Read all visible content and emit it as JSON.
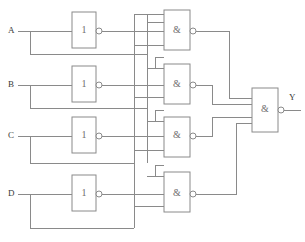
{
  "figure": {
    "caption": "",
    "background_color": "#ffffff",
    "wire_color": "#8a8a8a",
    "label_color": "#3a3a3a"
  },
  "inputs": [
    {
      "id": "A",
      "label": "A",
      "y": 31
    },
    {
      "id": "B",
      "label": "B",
      "y": 85
    },
    {
      "id": "C",
      "label": "C",
      "y": 136
    },
    {
      "id": "D",
      "label": "D",
      "y": 194
    }
  ],
  "output": {
    "id": "Y",
    "label": "Y",
    "y": 110
  },
  "inverters": [
    {
      "id": "inv-a",
      "label": "1",
      "x": 72,
      "y": 12,
      "w": 24,
      "h": 36,
      "input": "A"
    },
    {
      "id": "inv-b",
      "label": "1",
      "x": 72,
      "y": 66,
      "w": 24,
      "h": 36,
      "input": "B"
    },
    {
      "id": "inv-c",
      "label": "1",
      "x": 72,
      "y": 117,
      "w": 24,
      "h": 36,
      "input": "C"
    },
    {
      "id": "inv-d",
      "label": "1",
      "x": 72,
      "y": 175,
      "w": 24,
      "h": 36,
      "input": "D"
    }
  ],
  "nand_gates": [
    {
      "id": "nand-1",
      "label": "&",
      "x": 164,
      "y": 10,
      "w": 26,
      "h": 40,
      "inputs": 3
    },
    {
      "id": "nand-2",
      "label": "&",
      "x": 164,
      "y": 64,
      "w": 26,
      "h": 40,
      "inputs": 3
    },
    {
      "id": "nand-3",
      "label": "&",
      "x": 164,
      "y": 117,
      "w": 26,
      "h": 40,
      "inputs": 3
    },
    {
      "id": "nand-4",
      "label": "&",
      "x": 164,
      "y": 172,
      "w": 26,
      "h": 40,
      "inputs": 3
    }
  ],
  "output_gate": {
    "id": "nand-out",
    "label": "&",
    "x": 252,
    "y": 88,
    "w": 26,
    "h": 44,
    "inputs": 4
  },
  "bus_lines": [
    {
      "id": "bus-1",
      "x": 134
    },
    {
      "id": "bus-2",
      "x": 147
    }
  ]
}
